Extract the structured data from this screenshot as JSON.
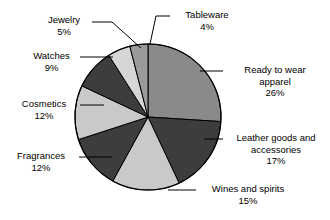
{
  "chart_data": {
    "type": "pie",
    "title": "",
    "subtitle": "",
    "xlabel": "",
    "ylabel": "",
    "legend_position": "callout-labels",
    "grid": false,
    "units": "percent",
    "total": 100,
    "start_angle_deg": 0,
    "direction": "clockwise",
    "categories": [
      "Ready to wear apparel",
      "Leather goods and accessories",
      "Wines and spirits",
      "Fragrances",
      "Cosmetics",
      "Watches",
      "Jewelry",
      "Tableware"
    ],
    "values": [
      26,
      17,
      15,
      12,
      12,
      9,
      5,
      4
    ],
    "slices": [
      {
        "name": "ready-to-wear",
        "label_line1": "Ready to wear",
        "label_line2": "apparel",
        "percent_text": "26%",
        "value": 26,
        "color": "#8a8a8a"
      },
      {
        "name": "leather-goods",
        "label_line1": "Leather goods and",
        "label_line2": "accessories",
        "percent_text": "17%",
        "value": 17,
        "color": "#3d3d3d"
      },
      {
        "name": "wines-and-spirits",
        "label_line1": "Wines and spirits",
        "label_line2": "",
        "percent_text": "15%",
        "value": 15,
        "color": "#c9c9c9"
      },
      {
        "name": "fragrances",
        "label_line1": "Fragrances",
        "label_line2": "",
        "percent_text": "12%",
        "value": 12,
        "color": "#3d3d3d"
      },
      {
        "name": "cosmetics",
        "label_line1": "Cosmetics",
        "label_line2": "",
        "percent_text": "12%",
        "value": 12,
        "color": "#c9c9c9"
      },
      {
        "name": "watches",
        "label_line1": "Watches",
        "label_line2": "",
        "percent_text": "9%",
        "value": 9,
        "color": "#3d3d3d"
      },
      {
        "name": "jewelry",
        "label_line1": "Jewelry",
        "label_line2": "",
        "percent_text": "5%",
        "value": 5,
        "color": "#d6d6d6"
      },
      {
        "name": "tableware",
        "label_line1": "Tableware",
        "label_line2": "",
        "percent_text": "4%",
        "value": 4,
        "color": "#9a9a9a"
      }
    ],
    "colors": {
      "outline": "#000000",
      "leader_line": "#000000",
      "background": "#ffffff",
      "text": "#000000"
    }
  }
}
